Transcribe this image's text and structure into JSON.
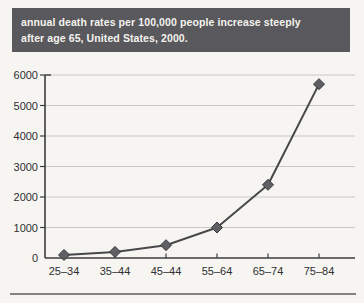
{
  "page": {
    "background": "#f6f5f1"
  },
  "header": {
    "title_line1": "annual death rates per 100,000 people increase steeply",
    "title_line2": "after age 65, United States, 2000.",
    "background": "#59585c",
    "text_color": "#f4f3ee"
  },
  "chart_data": {
    "type": "line",
    "title": "annual death rates per 100,000 people increase steeply after age 65, United States, 2000.",
    "categories": [
      "25–34",
      "35–44",
      "45–44",
      "55–64",
      "65–74",
      "75–84"
    ],
    "values": [
      100,
      200,
      420,
      1000,
      2400,
      5700
    ],
    "xlabel": "",
    "ylabel": "",
    "ylim": [
      0,
      6000
    ],
    "yticks": [
      0,
      1000,
      2000,
      3000,
      4000,
      5000,
      6000
    ],
    "grid": true,
    "legend": "none",
    "marker": "diamond",
    "colors": {
      "axis": "#3d3d40",
      "grid": "#c9c8c4",
      "line": "#48484b",
      "marker_fill": "#5f5f64",
      "marker_stroke": "#3a3a3e",
      "label": "#2f2f31"
    }
  },
  "footer": {
    "divider_color": "#82827f"
  }
}
